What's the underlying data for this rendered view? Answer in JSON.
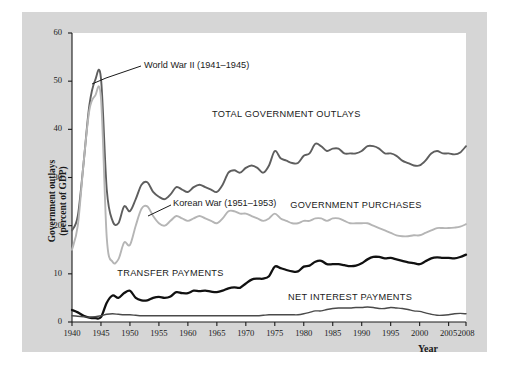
{
  "chart_data": {
    "type": "line",
    "title": "",
    "xlabel": "Year",
    "ylabel": "Government outlays (percent of GDP)",
    "ylabel_line1": "Government outlays",
    "ylabel_line2": "(percent of GDP)",
    "xlim": [
      1940,
      2008
    ],
    "ylim": [
      0,
      60
    ],
    "grid": false,
    "legend": "inline-labels",
    "ytick_labels": [
      "0",
      "10",
      "20",
      "30",
      "40",
      "50",
      "60"
    ],
    "ytick_values": [
      0,
      10,
      20,
      30,
      40,
      50,
      60
    ],
    "xtick_labels": [
      "1940",
      "1945",
      "1950",
      "1955",
      "1960",
      "1965",
      "1970",
      "1975",
      "1980",
      "1985",
      "1990",
      "1995",
      "2000",
      "2005",
      "2008"
    ],
    "xtick_values": [
      1940,
      1945,
      1950,
      1955,
      1960,
      1965,
      1970,
      1975,
      1980,
      1985,
      1990,
      1995,
      2000,
      2005,
      2008
    ],
    "annotations": [
      {
        "name": "world-war-2",
        "text": "World War II (1941–1945)",
        "points_to_year": 1943,
        "points_to_value": 50
      },
      {
        "name": "korean-war",
        "text": "Korean War (1951–1953)",
        "points_to_year": 1953,
        "points_to_value": 23
      }
    ],
    "x": [
      1940,
      1941,
      1942,
      1943,
      1944,
      1945,
      1946,
      1947,
      1948,
      1949,
      1950,
      1951,
      1952,
      1953,
      1954,
      1955,
      1956,
      1957,
      1958,
      1959,
      1960,
      1961,
      1962,
      1963,
      1964,
      1965,
      1966,
      1967,
      1968,
      1969,
      1970,
      1971,
      1972,
      1973,
      1974,
      1975,
      1976,
      1977,
      1978,
      1979,
      1980,
      1981,
      1982,
      1983,
      1984,
      1985,
      1986,
      1987,
      1988,
      1989,
      1990,
      1991,
      1992,
      1993,
      1994,
      1995,
      1996,
      1997,
      1998,
      1999,
      2000,
      2001,
      2002,
      2003,
      2004,
      2005,
      2006,
      2007,
      2008
    ],
    "series": [
      {
        "name": "TOTAL GOVERNMENT OUTLAYS",
        "color": "#5e5e5e",
        "width": 1.9,
        "label_year": 1977,
        "label_value": 43,
        "values": [
          19.0,
          22.0,
          33.0,
          45.0,
          50.2,
          50.6,
          27.5,
          21.0,
          20.5,
          24.0,
          23.0,
          25.5,
          28.5,
          29.0,
          27.0,
          26.0,
          25.5,
          26.5,
          28.0,
          27.5,
          27.0,
          28.0,
          28.5,
          28.0,
          27.5,
          27.0,
          28.5,
          31.0,
          31.5,
          31.0,
          32.0,
          32.5,
          32.0,
          31.0,
          32.5,
          35.5,
          34.0,
          33.5,
          33.0,
          33.0,
          34.5,
          35.0,
          37.0,
          36.5,
          35.5,
          36.0,
          36.0,
          35.0,
          35.0,
          35.0,
          35.5,
          36.5,
          36.5,
          36.0,
          35.0,
          35.0,
          34.5,
          33.5,
          33.0,
          32.5,
          32.5,
          33.5,
          35.0,
          35.5,
          35.0,
          35.0,
          34.8,
          35.2,
          36.5
        ]
      },
      {
        "name": "GOVERNMENT PURCHASES",
        "color": "#b5b5b5",
        "width": 1.9,
        "label_year": 1989,
        "label_value": 24,
        "values": [
          15.0,
          20.0,
          33.0,
          44.0,
          47.0,
          46.5,
          17.5,
          12.5,
          13.0,
          16.5,
          16.0,
          20.0,
          23.5,
          24.0,
          22.0,
          20.5,
          20.0,
          21.0,
          22.0,
          21.5,
          21.0,
          21.5,
          22.0,
          21.5,
          21.0,
          20.5,
          21.5,
          23.0,
          23.0,
          22.5,
          22.5,
          22.0,
          21.5,
          21.0,
          21.5,
          22.5,
          21.5,
          21.0,
          20.5,
          20.5,
          21.0,
          21.0,
          21.5,
          21.5,
          21.0,
          21.5,
          21.5,
          21.0,
          20.5,
          20.5,
          20.5,
          20.5,
          20.0,
          19.5,
          19.0,
          18.5,
          18.0,
          17.8,
          17.8,
          18.0,
          18.0,
          18.5,
          19.0,
          19.5,
          19.5,
          19.5,
          19.6,
          19.8,
          20.3
        ]
      },
      {
        "name": "TRANSFER PAYMENTS",
        "color": "#111111",
        "width": 2.3,
        "label_year": 1957,
        "label_value": 10,
        "values": [
          2.5,
          2.0,
          1.3,
          0.9,
          0.8,
          1.0,
          4.0,
          5.5,
          5.0,
          6.0,
          6.5,
          5.0,
          4.5,
          4.5,
          5.0,
          5.2,
          5.0,
          5.3,
          6.2,
          6.0,
          6.0,
          6.5,
          6.4,
          6.5,
          6.3,
          6.2,
          6.5,
          7.0,
          7.2,
          7.1,
          8.0,
          8.8,
          9.0,
          9.0,
          9.5,
          11.5,
          11.2,
          10.8,
          10.5,
          10.5,
          11.5,
          11.7,
          12.5,
          12.7,
          12.0,
          12.0,
          12.0,
          11.8,
          11.6,
          11.7,
          12.2,
          13.0,
          13.5,
          13.5,
          13.2,
          13.3,
          13.0,
          12.7,
          12.4,
          12.2,
          12.0,
          12.6,
          13.2,
          13.4,
          13.3,
          13.3,
          13.2,
          13.5,
          14.0
        ]
      },
      {
        "name": "NET INTEREST PAYMENTS",
        "color": "#4a4a4a",
        "width": 1.4,
        "label_year": 1988,
        "label_value": 5,
        "values": [
          1.3,
          1.2,
          1.1,
          1.0,
          1.1,
          1.3,
          1.6,
          1.7,
          1.6,
          1.5,
          1.5,
          1.4,
          1.3,
          1.3,
          1.3,
          1.3,
          1.3,
          1.3,
          1.3,
          1.3,
          1.3,
          1.3,
          1.3,
          1.3,
          1.3,
          1.3,
          1.3,
          1.3,
          1.3,
          1.3,
          1.3,
          1.3,
          1.3,
          1.4,
          1.5,
          1.5,
          1.5,
          1.5,
          1.5,
          1.5,
          1.7,
          2.0,
          2.3,
          2.3,
          2.6,
          2.8,
          2.9,
          2.9,
          2.9,
          3.0,
          3.0,
          3.1,
          3.0,
          2.8,
          2.8,
          3.0,
          2.9,
          2.8,
          2.6,
          2.3,
          2.2,
          1.9,
          1.6,
          1.4,
          1.4,
          1.5,
          1.7,
          1.8,
          1.7
        ]
      }
    ]
  }
}
